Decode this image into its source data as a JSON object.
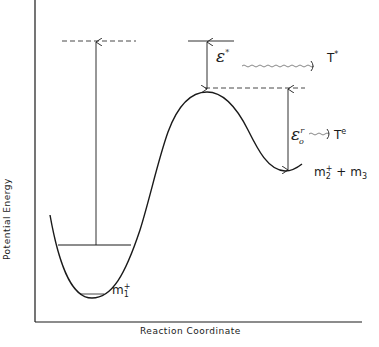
{
  "diagram": {
    "type": "potential-energy-surface",
    "axes": {
      "x_label": "Reaction Coordinate",
      "y_label": "Potential Energy"
    },
    "labels": {
      "epsilon_star": {
        "base": "ε",
        "sup": "*"
      },
      "T_star": {
        "base": "T",
        "sup": "*"
      },
      "epsilon_r": {
        "base": "ε",
        "sup": "r",
        "sub": "o"
      },
      "T_e": {
        "base": "T",
        "sup": "e"
      },
      "products": {
        "m2": "m",
        "m2_sub": "2",
        "m2_sup": "+",
        "plus": " + ",
        "m3": "m",
        "m3_sub": "3"
      },
      "reactant": {
        "base": "m",
        "sub": "1",
        "sup": "+"
      }
    },
    "colors": {
      "line": "#1a1a1a",
      "background": "#ffffff"
    }
  }
}
